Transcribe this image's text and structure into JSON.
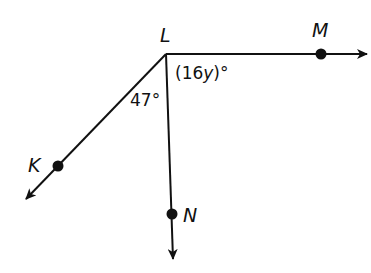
{
  "diagram": {
    "points": {
      "L": {
        "label": "L"
      },
      "M": {
        "label": "M"
      },
      "K": {
        "label": "K"
      },
      "N": {
        "label": "N"
      }
    },
    "rays": [
      "LM",
      "LK",
      "LN"
    ],
    "angles": {
      "MLN": {
        "label_pre": "(16",
        "label_var": "y",
        "label_post": ")°"
      },
      "KLN": {
        "label": "47°"
      }
    },
    "colors": {
      "stroke": "#111111",
      "background": "#ffffff"
    }
  }
}
